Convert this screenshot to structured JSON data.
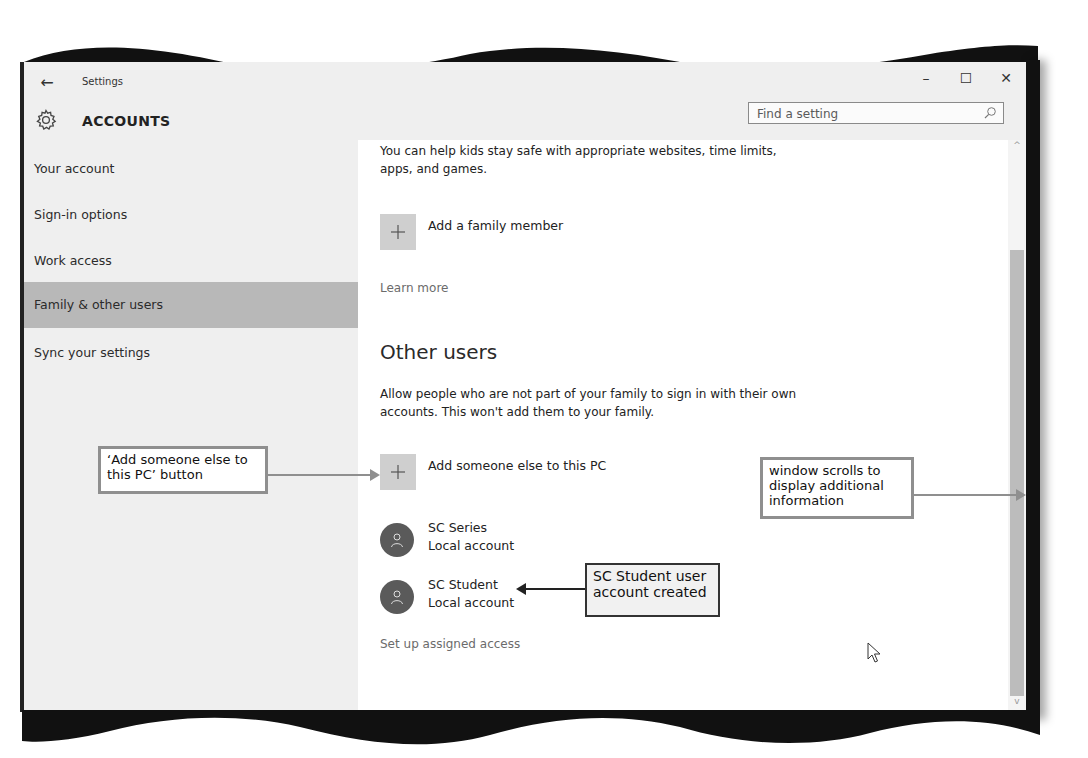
{
  "window": {
    "app_title": "Settings",
    "back_glyph": "←",
    "controls": {
      "minimize": "–",
      "maximize": "☐",
      "close": "✕"
    }
  },
  "header": {
    "section_title": "ACCOUNTS",
    "search": {
      "placeholder": "Find a setting",
      "value": ""
    }
  },
  "sidebar": {
    "items": [
      {
        "label": "Your account",
        "active": false
      },
      {
        "label": "Sign-in options",
        "active": false
      },
      {
        "label": "Work access",
        "active": false
      },
      {
        "label": "Family & other users",
        "active": true
      },
      {
        "label": "Sync your settings",
        "active": false
      }
    ]
  },
  "content": {
    "family_desc": "You can help kids stay safe with appropriate websites, time limits, apps, and games.",
    "add_family_label": "Add a family member",
    "learn_more": "Learn more",
    "other_users_heading": "Other users",
    "other_users_desc": "Allow people who are not part of your family to sign in with their own accounts. This won't add them to your family.",
    "add_someone_label": "Add someone else to this PC",
    "users": [
      {
        "name": "SC Series",
        "type": "Local account"
      },
      {
        "name": "SC Student",
        "type": "Local account"
      }
    ],
    "assigned_access": "Set up assigned access"
  },
  "callouts": {
    "add_someone": "‘Add someone else to this PC’ button",
    "scrolls": "window scrolls to display additional information",
    "student_created": "SC Student user account created"
  },
  "colors": {
    "active_nav": "#b8b8b8",
    "plus_button": "#cfcfcf",
    "avatar": "#5a5a5a",
    "scroll_thumb": "#bcbcbc"
  }
}
